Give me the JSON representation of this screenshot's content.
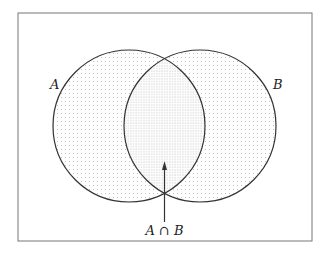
{
  "diagram": {
    "type": "venn",
    "sets": [
      {
        "label": "A"
      },
      {
        "label": "B"
      }
    ],
    "intersection_label": "A ∩ B",
    "colors": {
      "stroke": "#333333",
      "frame": "#777777",
      "dots": "#9a9a9a"
    }
  }
}
